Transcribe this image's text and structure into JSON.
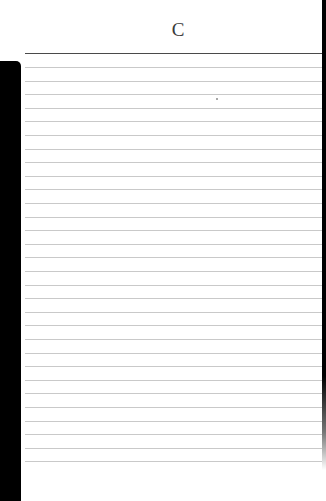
{
  "page": {
    "header_letter": "C",
    "ruled_line_count": 30,
    "line_spacing_px": 13.6,
    "colors": {
      "paper": "#ffffff",
      "header_rule": "#4a4a4a",
      "ruled_line": "#c9c9c9",
      "edge": "#000000",
      "letter": "#3a3a3a"
    }
  }
}
